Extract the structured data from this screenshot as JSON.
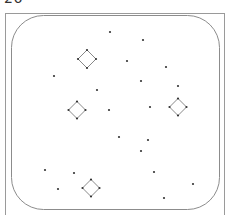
{
  "figure": {
    "label": "26",
    "colors": {
      "frame": "#9a9a9a",
      "inner_frame": "#8c8c8c",
      "diamond": "#7a7a7a",
      "dot": "#333333",
      "background": "#ffffff"
    },
    "outer_frame": {
      "x": 5,
      "y": 13,
      "width": 219,
      "height": 210
    },
    "inner_frame": {
      "x": 11,
      "y": 15,
      "width": 208,
      "height": 194,
      "radius": 32
    },
    "diamonds": [
      {
        "cx": 87,
        "cy": 59,
        "r": 9
      },
      {
        "cx": 77,
        "cy": 110,
        "r": 8.5
      },
      {
        "cx": 178,
        "cy": 107,
        "r": 8.5
      },
      {
        "cx": 91,
        "cy": 188,
        "r": 8.5
      }
    ],
    "dots": [
      {
        "x": 110,
        "y": 32
      },
      {
        "x": 143,
        "y": 40
      },
      {
        "x": 127,
        "y": 61
      },
      {
        "x": 166,
        "y": 67
      },
      {
        "x": 54,
        "y": 76
      },
      {
        "x": 141,
        "y": 81
      },
      {
        "x": 178,
        "y": 86
      },
      {
        "x": 97,
        "y": 90
      },
      {
        "x": 109,
        "y": 110
      },
      {
        "x": 150,
        "y": 107
      },
      {
        "x": 119,
        "y": 137
      },
      {
        "x": 148,
        "y": 140
      },
      {
        "x": 141,
        "y": 151
      },
      {
        "x": 45,
        "y": 170
      },
      {
        "x": 74,
        "y": 173
      },
      {
        "x": 154,
        "y": 172
      },
      {
        "x": 193,
        "y": 184
      },
      {
        "x": 58,
        "y": 189
      },
      {
        "x": 164,
        "y": 198
      }
    ]
  }
}
